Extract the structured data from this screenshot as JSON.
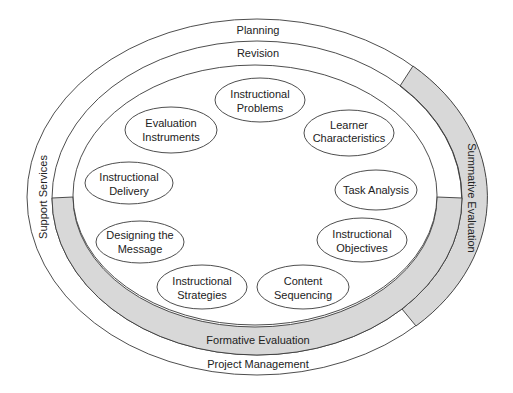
{
  "diagram": {
    "rings": {
      "planning": "Planning",
      "revision": "Revision",
      "support_services": "Support Services",
      "summative_evaluation": "Summative Evaluation",
      "formative_evaluation": "Formative Evaluation",
      "project_management": "Project Management"
    },
    "nodes": [
      {
        "id": "instructional-problems",
        "lines": [
          "Instructional",
          "Problems"
        ]
      },
      {
        "id": "learner-characteristics",
        "lines": [
          "Learner",
          "Characteristics"
        ]
      },
      {
        "id": "task-analysis",
        "lines": [
          "Task Analysis"
        ]
      },
      {
        "id": "instructional-objectives",
        "lines": [
          "Instructional",
          "Objectives"
        ]
      },
      {
        "id": "content-sequencing",
        "lines": [
          "Content",
          "Sequencing"
        ]
      },
      {
        "id": "instructional-strategies",
        "lines": [
          "Instructional",
          "Strategies"
        ]
      },
      {
        "id": "designing-the-message",
        "lines": [
          "Designing the",
          "Message"
        ]
      },
      {
        "id": "instructional-delivery",
        "lines": [
          "Instructional",
          "Delivery"
        ]
      },
      {
        "id": "evaluation-instruments",
        "lines": [
          "Evaluation",
          "Instruments"
        ]
      }
    ],
    "colors": {
      "band_fill": "#d8d8d8",
      "stroke": "#3a3a3a",
      "text": "#222222",
      "background": "#ffffff"
    }
  }
}
